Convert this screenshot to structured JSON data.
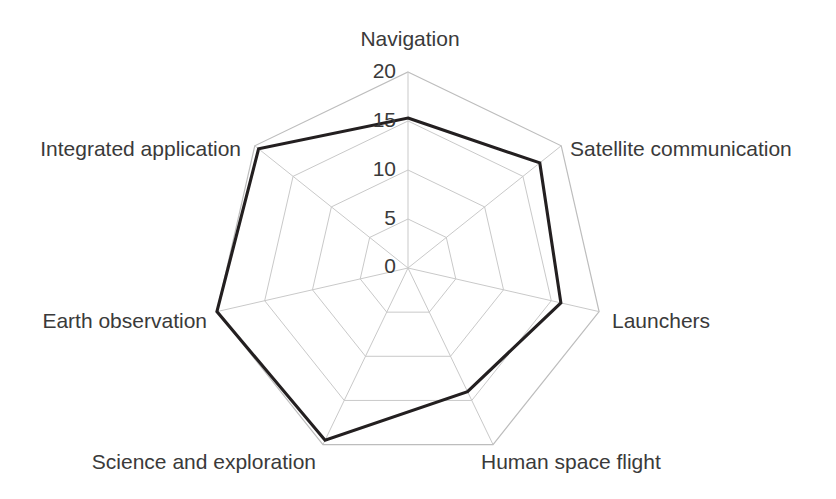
{
  "chart_data": {
    "type": "radar",
    "title": "",
    "subtitle": "",
    "xlabel": "",
    "ylabel": "",
    "categories": [
      "Navigation",
      "Satellite communication",
      "Launchers",
      "Human space flight",
      "Science and exploration",
      "Earth observation",
      "Integrated application"
    ],
    "values": [
      15.3,
      17.2,
      16.0,
      14.0,
      19.5,
      20.0,
      19.5
    ],
    "series": [
      {
        "name": "",
        "values": [
          15.3,
          17.2,
          16.0,
          14.0,
          19.5,
          20.0,
          19.5
        ]
      }
    ],
    "rlim": [
      0,
      20
    ],
    "tick_values": [
      0,
      5,
      10,
      15,
      20
    ],
    "tick_labels": [
      "0",
      "5",
      "10",
      "15",
      "20"
    ],
    "grid": true,
    "legend": "none",
    "series_color": "#231f20",
    "grid_color": "#c9c9c9",
    "text_color": "#3a3a3a",
    "background": "#ffffff"
  },
  "labels": {
    "navigation": "Navigation",
    "satellite_communication": "Satellite communication",
    "launchers": "Launchers",
    "human_space_flight": "Human space flight",
    "science_and_exploration": "Science and exploration",
    "earth_observation": "Earth observation",
    "integrated_application": "Integrated application"
  },
  "ticks": {
    "t0": "0",
    "t5": "5",
    "t10": "10",
    "t15": "15",
    "t20": "20"
  }
}
